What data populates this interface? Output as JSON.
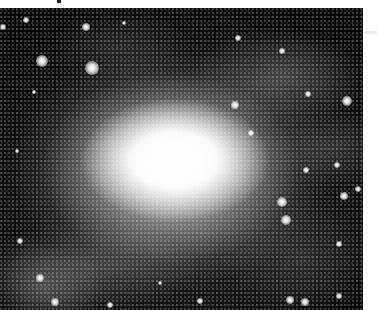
{
  "image": {
    "subject": "spiral galaxy",
    "description": "Black-and-white photograph of a barred spiral galaxy with a bright central core and star-speckled spiral arms",
    "colors": {
      "background": "#050505",
      "core": "#ffffff",
      "page": "#ffffff"
    },
    "bright_stars": [
      {
        "x": 42,
        "y": 53,
        "r": 6
      },
      {
        "x": 92,
        "y": 60,
        "r": 7
      },
      {
        "x": 86,
        "y": 19,
        "r": 4
      },
      {
        "x": 26,
        "y": 12,
        "r": 3
      },
      {
        "x": 3,
        "y": 19,
        "r": 3
      },
      {
        "x": 347,
        "y": 93,
        "r": 5
      },
      {
        "x": 344,
        "y": 188,
        "r": 4
      },
      {
        "x": 282,
        "y": 43,
        "r": 3
      },
      {
        "x": 238,
        "y": 30,
        "r": 3
      },
      {
        "x": 308,
        "y": 86,
        "r": 3
      },
      {
        "x": 282,
        "y": 194,
        "r": 5
      },
      {
        "x": 306,
        "y": 162,
        "r": 3
      },
      {
        "x": 337,
        "y": 157,
        "r": 3
      },
      {
        "x": 286,
        "y": 212,
        "r": 5
      },
      {
        "x": 358,
        "y": 181,
        "r": 3
      },
      {
        "x": 339,
        "y": 236,
        "r": 3
      },
      {
        "x": 290,
        "y": 292,
        "r": 4
      },
      {
        "x": 305,
        "y": 294,
        "r": 4
      },
      {
        "x": 339,
        "y": 288,
        "r": 3
      },
      {
        "x": 55,
        "y": 294,
        "r": 4
      },
      {
        "x": 110,
        "y": 297,
        "r": 3
      },
      {
        "x": 40,
        "y": 270,
        "r": 4
      },
      {
        "x": 20,
        "y": 233,
        "r": 3
      },
      {
        "x": 34,
        "y": 84,
        "r": 2
      },
      {
        "x": 17,
        "y": 143,
        "r": 2
      },
      {
        "x": 235,
        "y": 97,
        "r": 4
      },
      {
        "x": 251,
        "y": 125,
        "r": 3
      },
      {
        "x": 200,
        "y": 293,
        "r": 3
      },
      {
        "x": 160,
        "y": 275,
        "r": 2
      },
      {
        "x": 124,
        "y": 15,
        "r": 2
      }
    ]
  }
}
